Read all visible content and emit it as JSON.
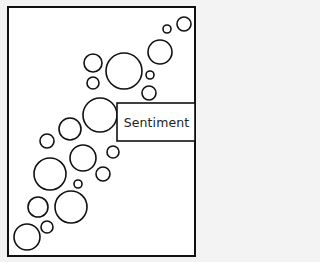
{
  "diagram": {
    "label": "Sentiment",
    "stroke_color": "#111111",
    "fill_color": "#ffffff",
    "background_color": "#f3f3f3",
    "frame": {
      "x": 8,
      "y": 7,
      "width": 187,
      "height": 249
    },
    "label_box": {
      "x": 117,
      "y": 103,
      "width": 78,
      "height": 38
    },
    "bubbles": [
      {
        "cx": 184,
        "cy": 24,
        "r": 7
      },
      {
        "cx": 167,
        "cy": 29,
        "r": 4
      },
      {
        "cx": 160,
        "cy": 52,
        "r": 12
      },
      {
        "cx": 93,
        "cy": 63,
        "r": 9
      },
      {
        "cx": 124,
        "cy": 71,
        "r": 18
      },
      {
        "cx": 150,
        "cy": 75,
        "r": 4
      },
      {
        "cx": 93,
        "cy": 83,
        "r": 6
      },
      {
        "cx": 149,
        "cy": 93,
        "r": 7
      },
      {
        "cx": 100,
        "cy": 115,
        "r": 17
      },
      {
        "cx": 70,
        "cy": 129,
        "r": 11
      },
      {
        "cx": 47,
        "cy": 141,
        "r": 7
      },
      {
        "cx": 83,
        "cy": 158,
        "r": 13
      },
      {
        "cx": 113,
        "cy": 152,
        "r": 6
      },
      {
        "cx": 50,
        "cy": 174,
        "r": 16
      },
      {
        "cx": 103,
        "cy": 174,
        "r": 7
      },
      {
        "cx": 78,
        "cy": 184,
        "r": 4
      },
      {
        "cx": 38,
        "cy": 207,
        "r": 10
      },
      {
        "cx": 71,
        "cy": 207,
        "r": 16
      },
      {
        "cx": 47,
        "cy": 227,
        "r": 6
      },
      {
        "cx": 27,
        "cy": 237,
        "r": 13
      }
    ]
  }
}
